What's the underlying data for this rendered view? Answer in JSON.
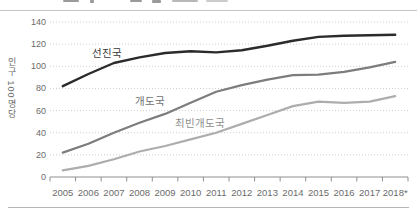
{
  "chart_data": {
    "type": "line",
    "title": "",
    "xlabel": "",
    "ylabel": "인구 100명당",
    "ylim": [
      0,
      140
    ],
    "yticks": [
      0,
      20,
      40,
      60,
      80,
      100,
      120,
      140
    ],
    "grid": "horizontal-dotted",
    "legend_position": "inline-labels",
    "categories": [
      "2005",
      "2006",
      "2007",
      "2008",
      "2009",
      "2010",
      "2011",
      "2012",
      "2013",
      "2014",
      "2015",
      "2016",
      "2017",
      "2018*"
    ],
    "series": [
      {
        "key": "developed",
        "name": "선진국",
        "color": "#2b2b2b",
        "values": [
          82,
          93,
          103,
          108,
          112,
          113.5,
          112.5,
          114.5,
          118.5,
          123,
          126.5,
          127.5,
          128,
          128.5
        ]
      },
      {
        "key": "developing",
        "name": "개도국",
        "color": "#7d7d7d",
        "values": [
          22,
          30,
          40,
          49,
          57,
          67,
          77,
          83,
          88,
          92,
          92.5,
          95,
          99,
          104
        ]
      },
      {
        "key": "least-developed",
        "name": "최빈개도국",
        "color": "#adadad",
        "values": [
          6,
          10,
          16,
          23,
          28,
          34,
          40,
          48,
          56,
          64,
          68,
          67,
          68,
          73
        ]
      }
    ],
    "colors": {
      "gridline": "#cfcfcf",
      "axis": "#8f8f8f",
      "tick_label": "#6b6b6b",
      "series_label": [
        "#3a3a3a",
        "#6f6f6f",
        "#8e8e8e"
      ]
    }
  }
}
